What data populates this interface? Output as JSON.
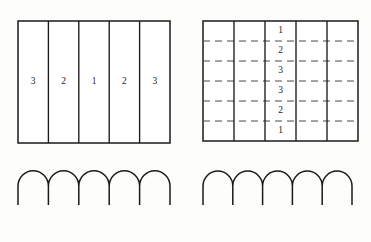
{
  "figure": {
    "background_color": "#fdfdfb",
    "stroke_color": "#1a1a1a",
    "dashed_stroke_color": "#4a4a4a",
    "panels": [
      {
        "id": "top-left-striped-rectangle",
        "name": "Rectangle divided into five vertical strips",
        "type": "grid",
        "x": 18,
        "y": 21,
        "width": 152,
        "height": 122,
        "columns": 5,
        "rows": 1,
        "vertical_dividers": "solid",
        "horizontal_dividers": "none",
        "labels": [
          "3",
          "2",
          "1",
          "2",
          "3"
        ],
        "label_row_index": 0,
        "label_placement": "one per column, vertically centered"
      },
      {
        "id": "top-right-dashed-grid",
        "name": "Rectangle with five vertical strips and six dashed rows",
        "type": "grid",
        "x": 203,
        "y": 21,
        "width": 155,
        "height": 120,
        "columns": 5,
        "rows": 6,
        "vertical_dividers": "solid",
        "horizontal_dividers": "dashed",
        "labels": [
          "1",
          "2",
          "3",
          "3",
          "2",
          "1"
        ],
        "label_column_index": 2,
        "label_placement": "center column only, one per row"
      },
      {
        "id": "bottom-left-arches",
        "name": "Row of five semicircular arches",
        "type": "arches",
        "x": 18,
        "y": 186,
        "width": 152,
        "arch_count": 5,
        "arch_radius": 15.2,
        "leg_length": 19
      },
      {
        "id": "bottom-right-arches",
        "name": "Row of five semicircular arches",
        "type": "arches",
        "x": 203,
        "y": 186,
        "width": 149,
        "arch_count": 5,
        "arch_radius": 14.9,
        "leg_length": 19
      }
    ]
  }
}
